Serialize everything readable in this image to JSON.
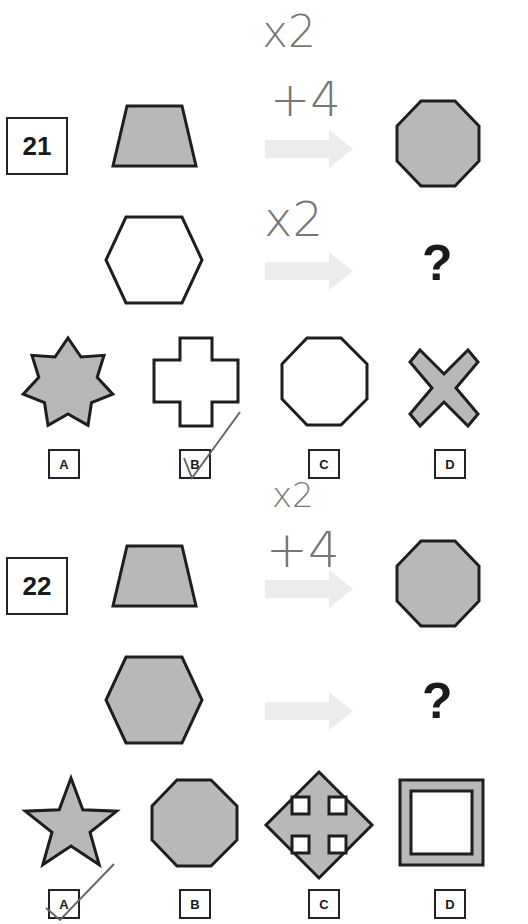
{
  "colors": {
    "shape_fill": "#b8b8b8",
    "shape_stroke": "#1e1e1e",
    "arrow": "#ececec",
    "handwriting": "#777777"
  },
  "questions": [
    {
      "number": "21",
      "example_row": {
        "from": "gray trapezoid",
        "to": "gray octagon"
      },
      "question_row": {
        "from": "white hexagon",
        "to": "?"
      },
      "handwritten_notes": [
        "x2",
        "+4",
        "x2"
      ],
      "options": [
        {
          "label": "A",
          "shape": "gray 7-point star"
        },
        {
          "label": "B",
          "shape": "white plus/cross",
          "checked": true
        },
        {
          "label": "C",
          "shape": "white octagon"
        },
        {
          "label": "D",
          "shape": "gray X"
        }
      ]
    },
    {
      "number": "22",
      "example_row": {
        "from": "gray trapezoid",
        "to": "gray octagon"
      },
      "question_row": {
        "from": "gray hexagon",
        "to": "?"
      },
      "handwritten_notes": [
        "x2",
        "+4"
      ],
      "options": [
        {
          "label": "A",
          "shape": "gray 5-point star",
          "checked": true
        },
        {
          "label": "B",
          "shape": "gray octagon"
        },
        {
          "label": "C",
          "shape": "gray diamond with four notches"
        },
        {
          "label": "D",
          "shape": "gray square frame"
        }
      ]
    }
  ],
  "question_mark": "?"
}
